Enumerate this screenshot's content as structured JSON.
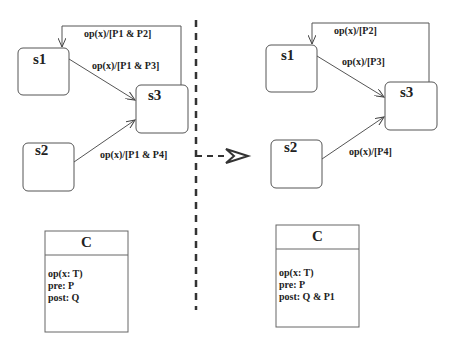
{
  "before": {
    "states": [
      {
        "name": "s1"
      },
      {
        "name": "s2"
      },
      {
        "name": "s3"
      }
    ],
    "transitions": [
      {
        "from": "s3",
        "to": "s1",
        "label": "op(x)/[P1 & P2]"
      },
      {
        "from": "s1",
        "to": "s3",
        "label": "op(x)/[P1 & P3]"
      },
      {
        "from": "s2",
        "to": "s3",
        "label": "op(x)/[P1 & P4]"
      }
    ],
    "class": {
      "name": "C",
      "lines": [
        "op(x: T)",
        "pre: P",
        "post: Q"
      ]
    }
  },
  "after": {
    "states": [
      {
        "name": "s1"
      },
      {
        "name": "s2"
      },
      {
        "name": "s3"
      }
    ],
    "transitions": [
      {
        "from": "s3",
        "to": "s1",
        "label": "op(x)/[P2]"
      },
      {
        "from": "s1",
        "to": "s3",
        "label": "op(x)/[P3]"
      },
      {
        "from": "s2",
        "to": "s3",
        "label": "op(x)/[P4]"
      }
    ],
    "class": {
      "name": "C",
      "lines": [
        "op(x: T)",
        "pre: P",
        "post: Q & P1"
      ]
    }
  }
}
